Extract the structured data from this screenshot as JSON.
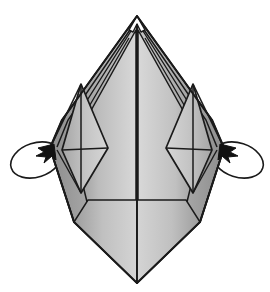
{
  "figure": {
    "title": "Origami folding step diagram",
    "domain": "origami-instruction",
    "symmetry": "bilateral-vertical",
    "canvas": {
      "width": 270,
      "height": 292
    }
  },
  "palette": {
    "background": "#ffffff",
    "paper_light": "#d4d4d4",
    "paper_mid": "#c2c2c2",
    "paper_shade": "#a8a8a8",
    "paper_dark": "#8f8f8f",
    "paper_highlight": "#e3e3e3",
    "ink": "#1a1a1a",
    "ink_soft": "#2b2b2b"
  },
  "geometry": {
    "top_apex": {
      "x": 137,
      "y": 16
    },
    "bottom_apex": {
      "x": 137,
      "y": 283
    },
    "left_outer_vertex": {
      "x": 50,
      "y": 148
    },
    "right_outer_vertex": {
      "x": 224,
      "y": 148
    },
    "center_fold_x": 137,
    "left_shoulder": {
      "x": 74,
      "y": 222
    },
    "right_shoulder": {
      "x": 200,
      "y": 222
    }
  },
  "parts": {
    "body_label": "Folded paper body",
    "center_fold_label": "Center vertical fold",
    "top_notch_label": "Layered top point notch",
    "left_flap_label": "Left inner flap",
    "right_flap_label": "Right inner flap",
    "left_layers_label": "Left layered paper edges",
    "right_layers_label": "Right layered paper edges"
  },
  "annotations": {
    "arrows": [
      {
        "id": "left-rotation-arrow",
        "side": "left",
        "type": "rotate-around-ellipse",
        "meaning": "Swing the left flap around to the back",
        "arrowhead_at": {
          "x": 54,
          "y": 144
        },
        "arrowhead_direction": "up-right"
      },
      {
        "id": "right-rotation-arrow",
        "side": "right",
        "type": "rotate-around-ellipse",
        "meaning": "Swing the right flap around to the back",
        "arrowhead_at": {
          "x": 220,
          "y": 144
        },
        "arrowhead_direction": "up-left"
      }
    ]
  }
}
